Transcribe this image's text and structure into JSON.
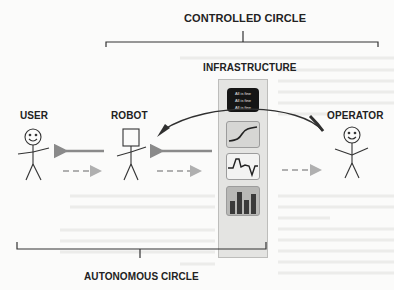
{
  "diagram": {
    "top_label": "CONTROLLED CIRCLE",
    "bottom_label": "AUTONOMOUS CIRCLE",
    "infrastructure": {
      "title": "INFRASTRUCTURE",
      "status_panel": {
        "lines": [
          "All is fine",
          "All is fine",
          "All is fine"
        ]
      },
      "widgets": [
        "line-chart-icon",
        "fluctuating-chart-icon",
        "bar-chart-icon"
      ]
    },
    "actors": [
      {
        "id": "user",
        "label": "USER"
      },
      {
        "id": "robot",
        "label": "ROBOT"
      },
      {
        "id": "operator",
        "label": "OPERATOR"
      }
    ],
    "arrows": [
      {
        "from": "robot",
        "to": "user",
        "style": "solid"
      },
      {
        "from": "user",
        "to": "robot",
        "style": "dashed"
      },
      {
        "from": "infrastructure",
        "to": "robot",
        "style": "solid"
      },
      {
        "from": "robot",
        "to": "infrastructure",
        "style": "dashed"
      },
      {
        "from": "infrastructure",
        "to": "operator",
        "style": "dashed"
      },
      {
        "from": "operator",
        "to": "robot",
        "style": "curved-solid"
      }
    ],
    "colors": {
      "arrow": "#8a8a8a",
      "dashed_arrow": "#b0b0b0",
      "curved_arrow": "#303030",
      "panel_bg": "#e4e4e2",
      "status_bg": "#151515"
    }
  }
}
